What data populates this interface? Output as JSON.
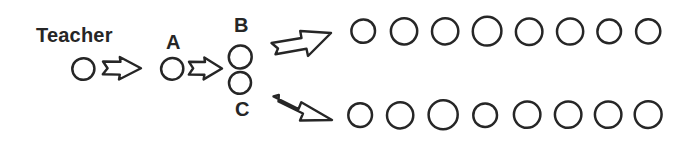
{
  "diagram": {
    "background_color": "#ffffff",
    "ink_color": "#262626",
    "labels": {
      "teacher": "Teacher",
      "a": "A",
      "b": "B",
      "c": "C"
    },
    "nodes": [
      {
        "id": "teacher",
        "label": "Teacher",
        "shape": "hand-drawn-circle",
        "cx": 83,
        "cy": 69,
        "r": 11
      },
      {
        "id": "a",
        "label": "A",
        "shape": "hand-drawn-circle",
        "cx": 172,
        "cy": 69,
        "r": 11
      },
      {
        "id": "b",
        "label": "B",
        "shape": "hand-drawn-circle",
        "cx": 240,
        "cy": 57,
        "r": 11.5
      },
      {
        "id": "c",
        "label": "C",
        "shape": "hand-drawn-circle",
        "cx": 240,
        "cy": 83,
        "r": 11
      }
    ],
    "arrows": [
      {
        "id": "teacher-to-a",
        "from": "teacher",
        "to": "a",
        "direction": "right"
      },
      {
        "id": "a-to-bc",
        "from": "a",
        "to": "b-and-c",
        "direction": "right"
      },
      {
        "id": "b-to-row-1",
        "from": "b",
        "to": "row-1",
        "direction": "up-right"
      },
      {
        "id": "c-to-row-2",
        "from": "c",
        "to": "row-2",
        "direction": "down-right"
      }
    ],
    "rows": [
      {
        "id": "row-1",
        "source": "B",
        "count": 8,
        "circles": [
          {
            "cx": 363,
            "cy": 31,
            "r": 12
          },
          {
            "cx": 404,
            "cy": 31,
            "r": 13
          },
          {
            "cx": 445,
            "cy": 31,
            "r": 13
          },
          {
            "cx": 487,
            "cy": 31,
            "r": 14
          },
          {
            "cx": 529,
            "cy": 32,
            "r": 13
          },
          {
            "cx": 570,
            "cy": 31,
            "r": 13
          },
          {
            "cx": 609,
            "cy": 31,
            "r": 12
          },
          {
            "cx": 648,
            "cy": 31,
            "r": 12
          }
        ]
      },
      {
        "id": "row-2",
        "source": "C",
        "count": 8,
        "circles": [
          {
            "cx": 360,
            "cy": 115,
            "r": 12
          },
          {
            "cx": 400,
            "cy": 115,
            "r": 13
          },
          {
            "cx": 443,
            "cy": 114,
            "r": 14
          },
          {
            "cx": 485,
            "cy": 115,
            "r": 12
          },
          {
            "cx": 527,
            "cy": 114,
            "r": 13
          },
          {
            "cx": 568,
            "cy": 114,
            "r": 13
          },
          {
            "cx": 608,
            "cy": 114,
            "r": 13
          },
          {
            "cx": 648,
            "cy": 114,
            "r": 13
          }
        ]
      }
    ]
  }
}
